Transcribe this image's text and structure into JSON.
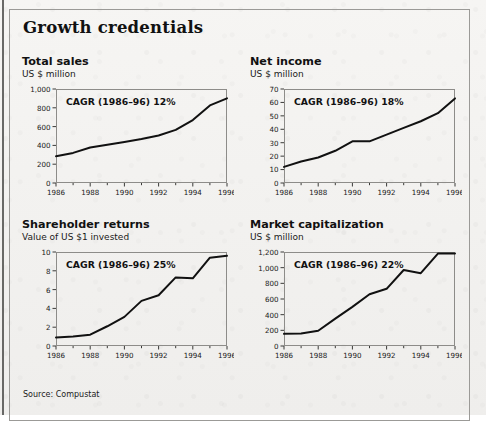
{
  "exhibit": {
    "title": "Growth credentials",
    "source": "Source: Compustat",
    "border_color": "#9b9a97",
    "line_color": "#111111",
    "background": "#f3f2f0"
  },
  "chart_data": [
    {
      "type": "line",
      "title": "Total sales",
      "subtitle": "US $ million",
      "ylabel": "US $ million",
      "xlabel": "",
      "annotation": "CAGR (1986–96) 12%",
      "grid": false,
      "legend": "none",
      "x": [
        1986,
        1987,
        1988,
        1989,
        1990,
        1991,
        1992,
        1993,
        1994,
        1995,
        1996
      ],
      "values": [
        285,
        320,
        378,
        408,
        437,
        468,
        505,
        565,
        670,
        825,
        900
      ],
      "xlim": [
        1986,
        1996
      ],
      "ylim": [
        0,
        1000
      ],
      "xticks": [
        1986,
        1988,
        1990,
        1992,
        1994,
        1996
      ],
      "xticklabels": [
        "1986",
        "1988",
        "1990",
        "1992",
        "1994",
        "1996"
      ],
      "yticks": [
        0,
        200,
        400,
        600,
        800,
        1000
      ],
      "yticklabels": [
        "0",
        "200",
        "400",
        "600",
        "800",
        "1,000"
      ]
    },
    {
      "type": "line",
      "title": "Net income",
      "subtitle": "US $ million",
      "ylabel": "US $ million",
      "xlabel": "",
      "annotation": "CAGR (1986–96) 18%",
      "grid": false,
      "legend": "none",
      "x": [
        1986,
        1987,
        1988,
        1989,
        1990,
        1991,
        1992,
        1993,
        1994,
        1995,
        1996
      ],
      "values": [
        12,
        16,
        19,
        24,
        31,
        31,
        36,
        41,
        46,
        52,
        63
      ],
      "xlim": [
        1986,
        1996
      ],
      "ylim": [
        0,
        70
      ],
      "xticks": [
        1986,
        1988,
        1990,
        1992,
        1994,
        1996
      ],
      "xticklabels": [
        "1986",
        "1988",
        "1990",
        "1992",
        "1994",
        "1996"
      ],
      "yticks": [
        0,
        10,
        20,
        30,
        40,
        50,
        60,
        70
      ],
      "yticklabels": [
        "0",
        "10",
        "20",
        "30",
        "40",
        "50",
        "60",
        "70"
      ]
    },
    {
      "type": "line",
      "title": "Shareholder returns",
      "subtitle": "Value of US $1 invested",
      "ylabel": "Value of US $1 invested",
      "xlabel": "",
      "annotation": "CAGR (1986–96) 25%",
      "grid": false,
      "legend": "none",
      "x": [
        1986,
        1987,
        1988,
        1989,
        1990,
        1991,
        1992,
        1993,
        1994,
        1995,
        1996
      ],
      "values": [
        0.9,
        1.0,
        1.2,
        2.1,
        3.1,
        4.8,
        5.4,
        7.3,
        7.2,
        9.4,
        9.6
      ],
      "xlim": [
        1986,
        1996
      ],
      "ylim": [
        0,
        10
      ],
      "xticks": [
        1986,
        1988,
        1990,
        1992,
        1994,
        1996
      ],
      "xticklabels": [
        "1986",
        "1988",
        "1990",
        "1992",
        "1994",
        "1996"
      ],
      "yticks": [
        0,
        2,
        4,
        6,
        8,
        10
      ],
      "yticklabels": [
        "0",
        "2",
        "4",
        "6",
        "8",
        "10"
      ]
    },
    {
      "type": "line",
      "title": "Market capitalization",
      "subtitle": "US $ million",
      "ylabel": "US $ million",
      "xlabel": "",
      "annotation": "CAGR (1986–96) 22%",
      "grid": false,
      "legend": "none",
      "x": [
        1986,
        1987,
        1988,
        1989,
        1990,
        1991,
        1992,
        1993,
        1994,
        1995,
        1996
      ],
      "values": [
        155,
        160,
        195,
        350,
        500,
        660,
        730,
        970,
        930,
        1180,
        1180
      ],
      "xlim": [
        1986,
        1996
      ],
      "ylim": [
        0,
        1200
      ],
      "xticks": [
        1986,
        1988,
        1990,
        1992,
        1994,
        1996
      ],
      "xticklabels": [
        "1986",
        "1988",
        "1990",
        "1992",
        "1994",
        "1996"
      ],
      "yticks": [
        0,
        200,
        400,
        600,
        800,
        1000,
        1200
      ],
      "yticklabels": [
        "0",
        "200",
        "400",
        "600",
        "800",
        "1,000",
        "1,200"
      ]
    }
  ]
}
